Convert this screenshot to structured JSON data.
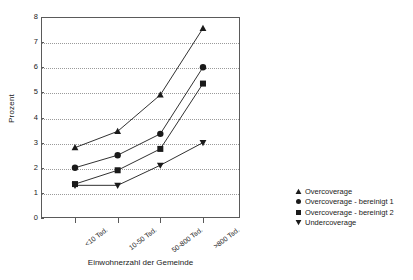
{
  "chart_data": {
    "type": "line",
    "title": "",
    "xlabel": "Einwohnerzahl der Gemeinde",
    "ylabel": "Prozent",
    "categories": [
      "<10 Tsd.",
      "10-50 Tsd.",
      "50-800 Tsd.",
      ">800 Tsd."
    ],
    "ylim": [
      0,
      8
    ],
    "yticks": [
      0,
      1,
      2,
      3,
      4,
      5,
      6,
      7,
      8
    ],
    "ytick_labels": [
      "0",
      "1",
      "2",
      "3",
      "4",
      "5",
      "6",
      "7",
      "8"
    ],
    "grid": "horizontal-dotted",
    "legend_position": "right",
    "series": [
      {
        "name": "Overcoverage",
        "marker": "triangle-up",
        "color": "#1a1a1a",
        "values": [
          2.8,
          3.45,
          4.9,
          7.55
        ]
      },
      {
        "name": "Overcoverage - bereinigt 1",
        "marker": "circle",
        "color": "#1a1a1a",
        "values": [
          2.0,
          2.5,
          3.35,
          6.0
        ]
      },
      {
        "name": "Overcoverage - bereinigt 2",
        "marker": "square",
        "color": "#1a1a1a",
        "values": [
          1.35,
          1.9,
          2.75,
          5.35
        ]
      },
      {
        "name": "Undercoverage",
        "marker": "triangle-down",
        "color": "#1a1a1a",
        "values": [
          1.3,
          1.3,
          2.1,
          3.0
        ]
      }
    ]
  },
  "legend": {
    "items": [
      {
        "label": "Overcoverage",
        "marker": "triangle-up"
      },
      {
        "label": "Overcoverage - bereinigt 1",
        "marker": "circle"
      },
      {
        "label": "Overcoverage - bereinigt 2",
        "marker": "square"
      },
      {
        "label": "Undercoverage",
        "marker": "triangle-down"
      }
    ]
  },
  "colors": {
    "ink": "#1a1a1a",
    "axis": "#5a5a5a",
    "grid": "#9a9a9a",
    "background": "#ffffff"
  }
}
